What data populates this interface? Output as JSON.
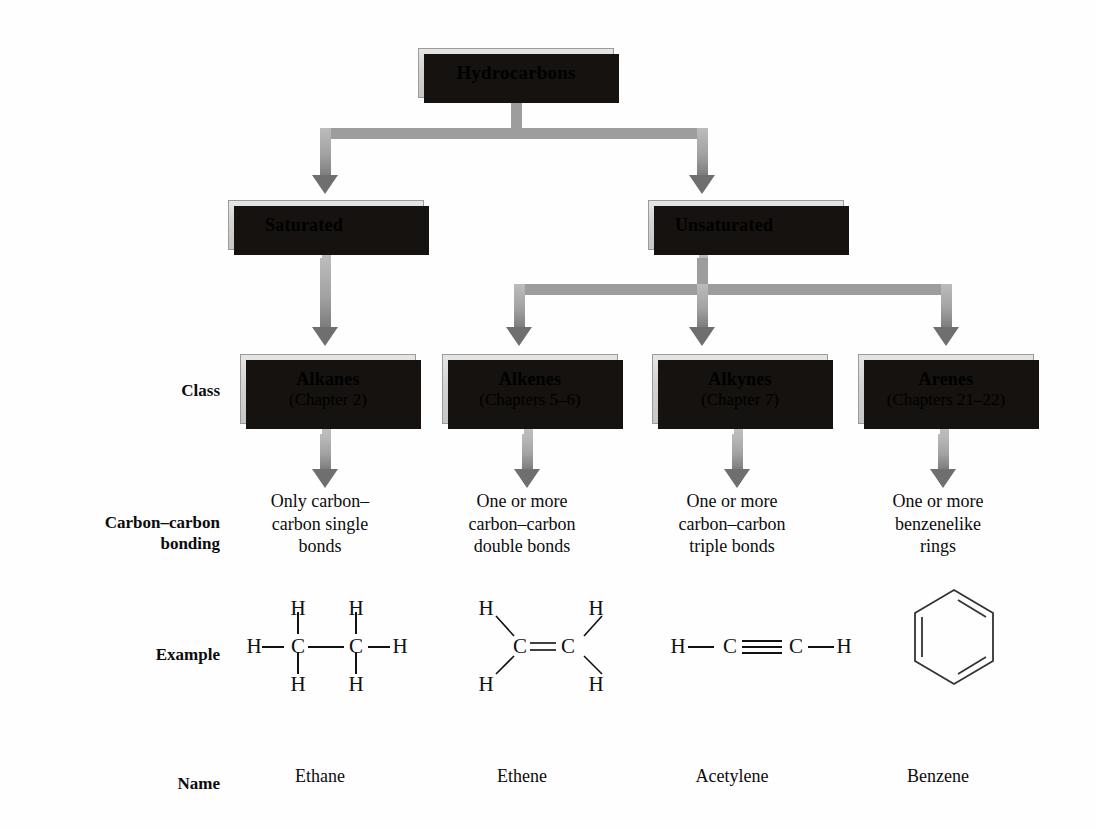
{
  "nodes": {
    "root": {
      "label": "Hydrocarbons"
    },
    "saturated": {
      "label": "Saturated"
    },
    "unsaturated": {
      "label": "Unsaturated"
    },
    "classes": [
      {
        "name": "Alkanes",
        "chapter": "(Chapter 2)"
      },
      {
        "name": "Alkenes",
        "chapter": "(Chapters 5–6)"
      },
      {
        "name": "Alkynes",
        "chapter": "(Chapter 7)"
      },
      {
        "name": "Arenes",
        "chapter": "(Chapters 21–22)"
      }
    ]
  },
  "row_labels": {
    "class": "Class",
    "bonding_line1": "Carbon–carbon",
    "bonding_line2": "bonding",
    "example": "Example",
    "name": "Name"
  },
  "bonding": [
    {
      "line1": "Only carbon–",
      "line2": "carbon single",
      "line3": "bonds"
    },
    {
      "line1": "One or more",
      "line2": "carbon–carbon",
      "line3": "double bonds"
    },
    {
      "line1": "One or more",
      "line2": "carbon–carbon",
      "line3": "triple bonds"
    },
    {
      "line1": "One or more",
      "line2": "benzenelike",
      "line3": "rings"
    }
  ],
  "examples": {
    "ethane": {
      "atoms": {
        "c1": "C",
        "c2": "C",
        "h_left": "H",
        "h_right": "H",
        "h_top1": "H",
        "h_top2": "H",
        "h_bot1": "H",
        "h_bot2": "H"
      },
      "bond_order": "single"
    },
    "ethene": {
      "atoms": {
        "c1": "C",
        "c2": "C",
        "h_tl": "H",
        "h_bl": "H",
        "h_tr": "H",
        "h_br": "H"
      },
      "bond_order": "double"
    },
    "acetylene": {
      "atoms": {
        "h_left": "H",
        "c1": "C",
        "c2": "C",
        "h_right": "H"
      },
      "bond_order": "triple"
    },
    "benzene": {
      "shape": "hexagon",
      "bond_order": "aromatic",
      "double_bond_edges": 3
    }
  },
  "names": [
    "Ethane",
    "Ethene",
    "Acetylene",
    "Benzene"
  ],
  "colors": {
    "box_fill_light": "#e6e6e6",
    "box_fill_dark": "#c6c6c6",
    "box_shadow": "#15120f",
    "connector": "#9d9d9d",
    "arrowhead": "#6f6f6f",
    "text": "#0c0c0c",
    "background": "#ffffff"
  }
}
